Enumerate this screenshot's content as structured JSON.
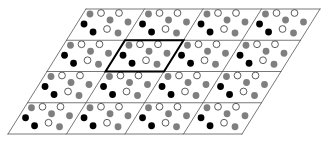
{
  "diagram": {
    "type": "lattice-tiling",
    "grid": {
      "rows": 4,
      "cols": 4,
      "origin_top_left": [
        86,
        9
      ],
      "cell_width": 58.5,
      "cell_height": 31.25,
      "shear": 0.624
    },
    "highlighted_cell": {
      "row": 1,
      "col": 1
    },
    "colors": {
      "line": "#555555",
      "highlight_line": "#000000",
      "gray_atom": "#7f7f7f",
      "black_atom": "#000000",
      "white_atom": "#ffffff",
      "atom_outline": "#333333"
    },
    "atom_radius": 3.4,
    "motif": [
      {
        "type": "gray",
        "u": 7.1,
        "v": 5
      },
      {
        "type": "white",
        "u": 17.5,
        "v": 4
      },
      {
        "type": "white",
        "u": 35.5,
        "v": 4
      },
      {
        "type": "gray",
        "u": 30.9,
        "v": 11
      },
      {
        "type": "gray",
        "u": 50.1,
        "v": 13
      },
      {
        "type": "black",
        "u": 7.4,
        "v": 15
      },
      {
        "type": "white",
        "u": 33.5,
        "v": 20
      },
      {
        "type": "black",
        "u": 21.4,
        "v": 23
      },
      {
        "type": "gray",
        "u": 47.0,
        "v": 24
      }
    ]
  }
}
